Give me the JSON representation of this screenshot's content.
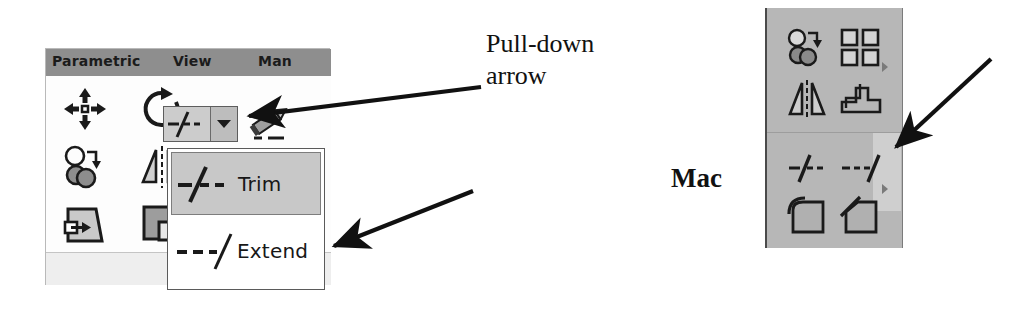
{
  "windows_panel": {
    "menubar": {
      "items": [
        "Parametric",
        "View",
        "Man"
      ]
    },
    "icons": [
      {
        "name": "move-icon",
        "title": "Move"
      },
      {
        "name": "rotate-icon",
        "title": "Rotate"
      },
      {
        "name": "copy-icon",
        "title": "Copy"
      },
      {
        "name": "mirror-icon",
        "title": "Mirror"
      },
      {
        "name": "scale-icon",
        "title": "Scale"
      },
      {
        "name": "stretch-icon",
        "title": "Stretch"
      }
    ],
    "split_button": {
      "main_icon": "trim-icon",
      "arrow_icon": "caret-down-icon",
      "neighbor_icon": "pencil-icon"
    },
    "panel_label": "Mod"
  },
  "dropdown": {
    "items": [
      {
        "label": "Trim",
        "icon": "trim-icon",
        "highlighted": true
      },
      {
        "label": "Extend",
        "icon": "extend-icon",
        "highlighted": false
      }
    ]
  },
  "annotations": {
    "callout_line1": "Pull-down",
    "callout_line2": "arrow",
    "mac_label": "Mac",
    "arrow_icon": "arrow-pointer-icon"
  },
  "mac_palette": {
    "icons": [
      {
        "name": "copy-icon",
        "title": "Copy"
      },
      {
        "name": "pattern-icon",
        "title": "Pattern"
      },
      {
        "name": "mirror-icon",
        "title": "Mirror"
      },
      {
        "name": "offset-icon",
        "title": "Offset"
      },
      {
        "name": "trim-icon",
        "title": "Trim"
      },
      {
        "name": "extend-icon",
        "title": "Extend"
      },
      {
        "name": "fillet-icon",
        "title": "Fillet"
      },
      {
        "name": "chamfer-icon",
        "title": "Chamfer"
      }
    ],
    "overflow_indicator": "more-triangle-icon"
  },
  "colors": {
    "menubar_bg": "#8e8e8e",
    "panel_bg": "#fdfdfd",
    "palette_bg": "#b7b7b7",
    "highlight_bg": "#c8c8c8",
    "ink": "#111111"
  }
}
